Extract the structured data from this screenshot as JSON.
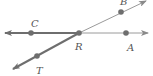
{
  "diagram": {
    "type": "geometry-rays",
    "colors": {
      "thin_line": "#9a9a9a",
      "thick_line": "#6e6e6e",
      "point": "#6e6e6e",
      "label": "#555555"
    },
    "points": [
      {
        "id": "C",
        "label": "C",
        "x": 31,
        "y": 33
      },
      {
        "id": "R",
        "label": "R",
        "x": 79,
        "y": 33
      },
      {
        "id": "A",
        "label": "A",
        "x": 126,
        "y": 33
      },
      {
        "id": "B",
        "label": "B",
        "x": 121,
        "y": 12
      },
      {
        "id": "T",
        "label": "T",
        "x": 37,
        "y": 56
      }
    ],
    "rays": [
      {
        "name": "ray-RC",
        "from": "R",
        "through": "C",
        "emphasized": true
      },
      {
        "name": "ray-RT",
        "from": "R",
        "through": "T",
        "emphasized": true
      },
      {
        "name": "ray-RA",
        "from": "R",
        "through": "A",
        "emphasized": false
      },
      {
        "name": "ray-RB",
        "from": "R",
        "through": "B",
        "emphasized": false
      }
    ],
    "labels": {
      "C": "C",
      "R": "R",
      "A": "A",
      "B": "B",
      "T": "T"
    }
  }
}
